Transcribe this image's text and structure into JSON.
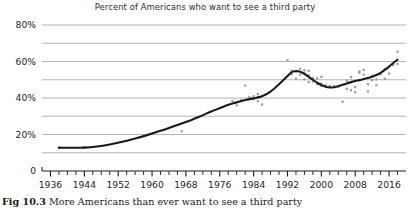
{
  "figure": {
    "title": "Percent of Americans who want to see a third party",
    "caption_label": "Fig 10.3",
    "caption_text": "  More Americans than ever want to see a third party"
  },
  "chart_data": {
    "type": "scatter",
    "title": "Percent of Americans who want to see a third party",
    "xlabel": "",
    "ylabel": "",
    "xlim": [
      1934,
      2020
    ],
    "ylim": [
      0,
      80
    ],
    "grid": true,
    "grid_axis": "y",
    "legend": "none",
    "y_major_ticks": [
      0,
      20,
      40,
      60,
      80
    ],
    "y_major_tick_labels": [
      "0",
      "20%",
      "40%",
      "60%",
      "80%"
    ],
    "y_minor_gridlines": [
      10,
      30,
      50,
      70
    ],
    "x_major_ticks": [
      1936,
      1944,
      1952,
      1960,
      1968,
      1976,
      1984,
      1992,
      2000,
      2008,
      2016
    ],
    "x_major_tick_labels": [
      "1936",
      "1944",
      "1952",
      "1960",
      "1968",
      "1976",
      "1984",
      "1992",
      "2000",
      "2008",
      "2016"
    ],
    "x_minor_tick_step": 2,
    "colors": {
      "trend_line": "#1a1a1a",
      "points": "#8a8a8a",
      "gridline": "#b4b4b4",
      "axis": "#1a1a1a",
      "text": "#1d1d1d"
    },
    "series": [
      {
        "name": "Smoothed trend",
        "type": "line",
        "x": [
          1938,
          1941,
          1944,
          1947,
          1950,
          1953,
          1956,
          1959,
          1962,
          1965,
          1968,
          1971,
          1974,
          1977,
          1980,
          1982,
          1984,
          1986,
          1988,
          1990,
          1992,
          1993,
          1994,
          1995,
          1996,
          1997,
          1998,
          1999,
          2000,
          2001,
          2002,
          2003,
          2004,
          2005,
          2006,
          2007,
          2008,
          2009,
          2010,
          2011,
          2012,
          2013,
          2014,
          2015,
          2016,
          2017,
          2018
        ],
        "y": [
          12.8,
          12.7,
          12.8,
          13.4,
          14.5,
          16.0,
          17.8,
          19.8,
          22.0,
          24.4,
          26.8,
          29.6,
          32.6,
          35.4,
          37.6,
          38.9,
          39.8,
          41.0,
          43.5,
          47.5,
          52.0,
          54.2,
          54.8,
          54.4,
          53.2,
          51.6,
          50.0,
          48.4,
          47.1,
          46.2,
          45.8,
          45.9,
          46.4,
          47.2,
          48.0,
          48.7,
          49.3,
          49.8,
          50.4,
          51.0,
          51.7,
          52.6,
          53.8,
          55.4,
          57.2,
          59.2,
          61.0
        ]
      },
      {
        "name": "Poll observations",
        "type": "scatter",
        "marker": "square",
        "points": [
          [
            1938,
            12.6
          ],
          [
            1944,
            13.0
          ],
          [
            1967,
            21.8
          ],
          [
            1979,
            38.4
          ],
          [
            1980,
            36.0
          ],
          [
            1981,
            38.8
          ],
          [
            1982,
            46.8
          ],
          [
            1983,
            40.4
          ],
          [
            1984,
            41.0
          ],
          [
            1984,
            39.4
          ],
          [
            1985,
            40.6
          ],
          [
            1985,
            42.2
          ],
          [
            1985,
            38.2
          ],
          [
            1986,
            36.4
          ],
          [
            1992,
            60.6
          ],
          [
            1993,
            55.0
          ],
          [
            1993,
            53.0
          ],
          [
            1994,
            54.4
          ],
          [
            1994,
            50.6
          ],
          [
            1995,
            52.8
          ],
          [
            1995,
            56.0
          ],
          [
            1996,
            53.6
          ],
          [
            1996,
            50.2
          ],
          [
            1996,
            55.2
          ],
          [
            1997,
            52.4
          ],
          [
            1997,
            48.8
          ],
          [
            1997,
            54.8
          ],
          [
            1998,
            51.0
          ],
          [
            1998,
            49.0
          ],
          [
            1999,
            47.6
          ],
          [
            1999,
            50.8
          ],
          [
            2000,
            48.0
          ],
          [
            2000,
            46.6
          ],
          [
            2000,
            51.6
          ],
          [
            2001,
            47.0
          ],
          [
            2002,
            46.6
          ],
          [
            2003,
            46.4
          ],
          [
            2004,
            46.2
          ],
          [
            2005,
            38.0
          ],
          [
            2006,
            49.4
          ],
          [
            2006,
            45.0
          ],
          [
            2007,
            51.4
          ],
          [
            2007,
            44.2
          ],
          [
            2008,
            46.0
          ],
          [
            2008,
            43.2
          ],
          [
            2009,
            53.8
          ],
          [
            2009,
            54.6
          ],
          [
            2010,
            52.8
          ],
          [
            2010,
            55.4
          ],
          [
            2011,
            47.6
          ],
          [
            2011,
            43.6
          ],
          [
            2012,
            49.8
          ],
          [
            2012,
            52.2
          ],
          [
            2013,
            50.2
          ],
          [
            2013,
            47.0
          ],
          [
            2014,
            53.0
          ],
          [
            2015,
            56.0
          ],
          [
            2015,
            50.6
          ],
          [
            2016,
            53.4
          ],
          [
            2017,
            58.0
          ],
          [
            2018,
            65.4
          ],
          [
            2018,
            58.6
          ]
        ]
      }
    ]
  }
}
